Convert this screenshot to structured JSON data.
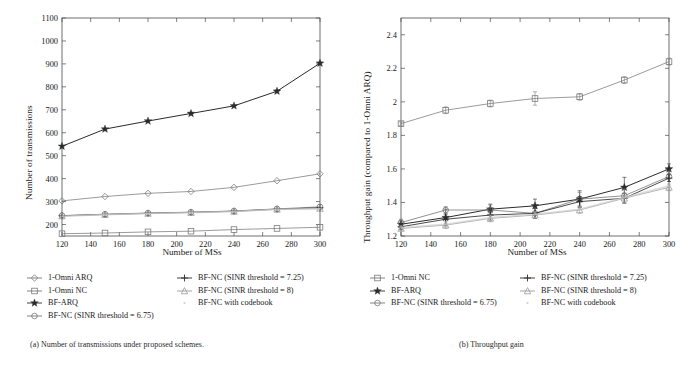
{
  "figure": {
    "panels": [
      {
        "id": "panel-a",
        "caption": "(a) Number of transmissions under proposed schemes.",
        "xlabel": "Number of MSs",
        "ylabel": "Number of transmissions"
      },
      {
        "id": "panel-b",
        "caption": "(b) Throughput gain",
        "xlabel": "Number of MSs",
        "ylabel": "Throughput gain (compared to 1-Omni ARQ)"
      }
    ]
  },
  "chart_data": [
    {
      "type": "line",
      "title": "(a) Number of transmissions under proposed schemes.",
      "xlabel": "Number of MSs",
      "ylabel": "Number of transmissions",
      "x": [
        120,
        150,
        180,
        210,
        240,
        270,
        300
      ],
      "xlim": [
        120,
        300
      ],
      "ylim": [
        150,
        1100
      ],
      "xticks": [
        120,
        140,
        160,
        180,
        200,
        220,
        240,
        260,
        280,
        300
      ],
      "yticks": [
        200,
        300,
        400,
        500,
        600,
        700,
        800,
        900,
        1000,
        1100
      ],
      "grid": false,
      "legend_position": "below",
      "series": [
        {
          "name": "1-Omni ARQ",
          "marker": "diamond",
          "values": [
            303,
            322,
            336,
            344,
            362,
            391,
            421
          ]
        },
        {
          "name": "1-Omni NC",
          "marker": "square",
          "values": [
            160,
            163,
            168,
            171,
            178,
            183,
            188
          ]
        },
        {
          "name": "BF-ARQ",
          "marker": "star",
          "values": [
            541,
            616,
            651,
            684,
            717,
            781,
            903
          ]
        },
        {
          "name": "BF-NC (SINR threshold = 6.75)",
          "marker": "circle",
          "values": [
            239,
            245,
            250,
            254,
            259,
            268,
            277
          ]
        },
        {
          "name": "BF-NC (SINR threshold = 7.25)",
          "marker": "plus",
          "values": [
            238,
            244,
            249,
            253,
            258,
            267,
            273
          ]
        },
        {
          "name": "BF-NC (SINR threshold = 8)",
          "marker": "triangle",
          "values": [
            237,
            243,
            248,
            252,
            257,
            266,
            270
          ]
        },
        {
          "name": "BF-NC with codebook",
          "marker": "dot",
          "values": [
            236,
            243,
            248,
            252,
            257,
            266,
            268
          ]
        }
      ]
    },
    {
      "type": "line",
      "title": "(b) Throughput gain",
      "xlabel": "Number of MSs",
      "ylabel": "Throughput gain (compared to 1-Omni ARQ)",
      "x": [
        120,
        150,
        180,
        210,
        240,
        270,
        300
      ],
      "xlim": [
        120,
        300
      ],
      "ylim": [
        1.2,
        2.5
      ],
      "xticks": [
        120,
        140,
        160,
        180,
        200,
        220,
        240,
        260,
        280,
        300
      ],
      "yticks": [
        1.2,
        1.4,
        1.6,
        1.8,
        2.0,
        2.2,
        2.4
      ],
      "ytick_labels": [
        "1.2",
        "1.4",
        "1.6",
        "1.8",
        "2",
        "2.2",
        "2.4"
      ],
      "grid": false,
      "legend_position": "below",
      "error_bars": true,
      "series": [
        {
          "name": "1-Omni NC",
          "marker": "square",
          "values": [
            1.87,
            1.95,
            1.99,
            2.02,
            2.03,
            2.13,
            2.24
          ],
          "errors": [
            0.01,
            0.02,
            0.02,
            0.04,
            0.02,
            0.02,
            0.02
          ]
        },
        {
          "name": "BF-ARQ",
          "marker": "star",
          "values": [
            1.27,
            1.31,
            1.36,
            1.38,
            1.42,
            1.49,
            1.6
          ],
          "errors": [
            0.02,
            0.05,
            0.03,
            0.04,
            0.05,
            0.06,
            0.03
          ]
        },
        {
          "name": "BF-NC (SINR threshold = 6.75)",
          "marker": "circle",
          "values": [
            1.28,
            1.355,
            1.355,
            1.335,
            1.42,
            1.44,
            1.555
          ],
          "errors": [
            0.02,
            0.02,
            0.03,
            0.03,
            0.04,
            0.04,
            0.03
          ]
        },
        {
          "name": "BF-NC (SINR threshold = 7.25)",
          "marker": "plus",
          "values": [
            1.255,
            1.3,
            1.325,
            1.335,
            1.405,
            1.425,
            1.545
          ],
          "errors": [
            0.015,
            0.03,
            0.03,
            0.03,
            0.03,
            0.03,
            0.02
          ]
        },
        {
          "name": "BF-NC (SINR threshold = 8)",
          "marker": "triangle",
          "values": [
            1.245,
            1.265,
            1.305,
            1.325,
            1.355,
            1.425,
            1.49
          ],
          "errors": [
            0.01,
            0.02,
            0.02,
            0.02,
            0.02,
            0.03,
            0.02
          ]
        },
        {
          "name": "BF-NC with codebook",
          "marker": "dot",
          "values": [
            1.25,
            1.27,
            1.31,
            1.33,
            1.36,
            1.43,
            1.5
          ],
          "errors": [
            0,
            0,
            0,
            0,
            0,
            0,
            0
          ]
        }
      ]
    }
  ],
  "legend_a": {
    "col1": [
      {
        "label": "1-Omni ARQ",
        "marker": "diamond"
      },
      {
        "label": "1-Omni NC",
        "marker": "square"
      },
      {
        "label": "BF-ARQ",
        "marker": "star"
      },
      {
        "label": "BF-NC (SINR threshold = 6.75)",
        "marker": "circle"
      }
    ],
    "col2": [
      {
        "label": "BF-NC (SINR threshold = 7.25)",
        "marker": "plus"
      },
      {
        "label": "BF-NC (SINR threshold = 8)",
        "marker": "triangle"
      },
      {
        "label": "BF-NC with codebook",
        "marker": "dot"
      }
    ]
  },
  "legend_b": {
    "col1": [
      {
        "label": "1-Omni NC",
        "marker": "square"
      },
      {
        "label": "BF-ARQ",
        "marker": "star"
      },
      {
        "label": "BF-NC (SINR threshold = 6.75)",
        "marker": "circle"
      }
    ],
    "col2": [
      {
        "label": "BF-NC (SINR threshold = 7.25)",
        "marker": "plus"
      },
      {
        "label": "BF-NC (SINR threshold = 8)",
        "marker": "triangle"
      },
      {
        "label": "BF-NC with codebook",
        "marker": "dot"
      }
    ]
  },
  "colors": {
    "axis": "#1a1a1a",
    "dark": "#333333",
    "mid": "#555555",
    "light": "#888888"
  }
}
